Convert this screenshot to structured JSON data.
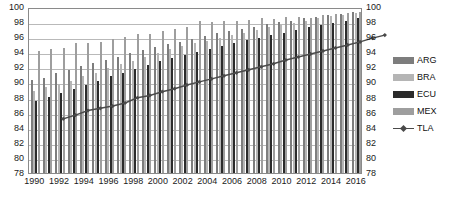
{
  "chart_data": {
    "type": "bar",
    "title": "",
    "subtitle": "",
    "xlabel": "",
    "ylabel": "",
    "ylim": [
      78,
      100
    ],
    "y_ticks": [
      78,
      80,
      82,
      84,
      86,
      88,
      90,
      92,
      94,
      96,
      98,
      100
    ],
    "secondary_y_axis": {
      "position": "right",
      "ylim": [
        78,
        100
      ],
      "ticks": [
        78,
        80,
        82,
        84,
        86,
        88,
        90,
        92,
        94,
        96,
        98,
        100
      ]
    },
    "grid": true,
    "legend_position": "right",
    "categories": [
      "1990",
      "1991",
      "1992",
      "1993",
      "1994",
      "1995",
      "1996",
      "1997",
      "1998",
      "1999",
      "2000",
      "2001",
      "2002",
      "2003",
      "2004",
      "2005",
      "2006",
      "2007",
      "2008",
      "2009",
      "2010",
      "2011",
      "2012",
      "2013",
      "2014",
      "2015",
      "2016"
    ],
    "x_tick_labels": [
      "1990",
      "1992",
      "1994",
      "1996",
      "1998",
      "2000",
      "2002",
      "2004",
      "2006",
      "2008",
      "2010",
      "2012",
      "2014",
      "2016"
    ],
    "series": [
      {
        "name": "ARG",
        "kind": "bar",
        "color": "#7d7d7d",
        "values": [
          90.3,
          90.6,
          91.2,
          91.7,
          92.2,
          92.6,
          93.0,
          93.4,
          93.9,
          94.3,
          94.7,
          95.1,
          95.4,
          95.8,
          96.1,
          96.5,
          96.8,
          97.1,
          97.4,
          97.7,
          98.0,
          98.2,
          98.5,
          98.7,
          98.9,
          99.1,
          99.3
        ]
      },
      {
        "name": "BRA",
        "kind": "bar",
        "color": "#b5b5b5",
        "values": [
          88.9,
          89.4,
          89.8,
          90.2,
          90.8,
          91.3,
          91.9,
          92.4,
          92.9,
          93.4,
          93.9,
          94.4,
          94.8,
          95.2,
          95.5,
          95.9,
          96.3,
          96.6,
          97.0,
          97.3,
          97.6,
          97.9,
          98.2,
          98.5,
          98.8,
          99.0,
          99.2
        ]
      },
      {
        "name": "ECU",
        "kind": "bar",
        "color": "#2b2b2b",
        "values": [
          87.6,
          88.1,
          88.6,
          89.2,
          89.7,
          90.2,
          90.8,
          91.3,
          91.8,
          92.3,
          92.8,
          93.2,
          93.6,
          94.0,
          94.4,
          94.8,
          95.2,
          95.6,
          95.9,
          96.3,
          96.6,
          97.0,
          97.3,
          97.6,
          97.9,
          98.2,
          98.5
        ]
      },
      {
        "name": "MEX",
        "kind": "bar",
        "color": "#9e9e9e",
        "values": [
          94.2,
          94.5,
          94.6,
          95.2,
          95.2,
          95.3,
          95.8,
          96.0,
          96.4,
          96.4,
          96.8,
          97.1,
          97.3,
          98.1,
          98.0,
          98.1,
          98.1,
          98.3,
          98.6,
          98.4,
          98.7,
          98.7,
          98.6,
          99.0,
          99.1,
          99.2,
          99.4
        ]
      },
      {
        "name": "TLA",
        "kind": "line",
        "color": "#4a4a4a",
        "marker": "diamond",
        "values": [
          86.5,
          87.0,
          87.6,
          87.9,
          88.2,
          88.6,
          89.3,
          89.6,
          90.1,
          90.5,
          91.0,
          91.4,
          91.8,
          92.2,
          92.6,
          93.0,
          93.4,
          93.8,
          94.3,
          94.7,
          95.1,
          95.5,
          95.9,
          96.3,
          96.7,
          97.2,
          97.6
        ]
      }
    ]
  },
  "legend": {
    "items": [
      {
        "label": "ARG",
        "swatch": "#7d7d7d",
        "type": "bar"
      },
      {
        "label": "BRA",
        "swatch": "#b5b5b5",
        "type": "bar"
      },
      {
        "label": "ECU",
        "swatch": "#2b2b2b",
        "type": "bar"
      },
      {
        "label": "MEX",
        "swatch": "#9e9e9e",
        "type": "bar"
      },
      {
        "label": "TLA",
        "swatch": "#4a4a4a",
        "type": "line-marker"
      }
    ]
  },
  "colors": {
    "grid": "#b9b9b9",
    "frame": "#8a8a8a",
    "text": "#1a1a1a",
    "background": "#ffffff"
  }
}
